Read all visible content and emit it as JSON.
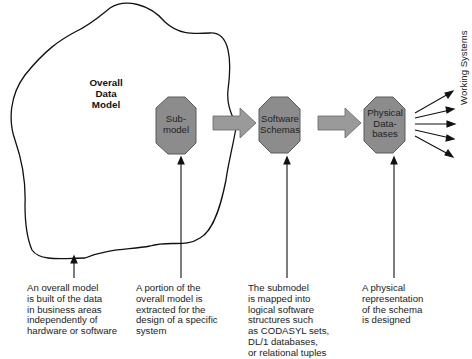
{
  "diagram": {
    "blob_title": "Overall\nData\nModel",
    "nodes": [
      {
        "id": "submodel",
        "label": "Sub-\nmodel"
      },
      {
        "id": "software-schemas",
        "label": "Software\nSchemas"
      },
      {
        "id": "physical-databases",
        "label": "Physical\nData-\nbases"
      }
    ],
    "output_label": "Working Systems",
    "captions": [
      {
        "id": "overall-model",
        "text": "An overall model\nis built of the data\nin business areas\nindependently of\nhardware or software"
      },
      {
        "id": "submodel",
        "text": "A portion of the\noverall model is\nextracted for the\ndesign of a specific\nsystem"
      },
      {
        "id": "software-schemas",
        "text": "The submodel\nis mapped into\nlogical software\nstructures such\nas CODASYL sets,\nDL/1 databases,\nor relational tuples"
      },
      {
        "id": "physical-databases",
        "text": "A physical\nrepresentation\nof the schema\nis designed"
      }
    ],
    "colors": {
      "octagon_fill": "#8c8c8c",
      "octagon_stroke": "#5a5a5a",
      "arrow_fill": "#9a9a9a",
      "line": "#111111"
    }
  }
}
